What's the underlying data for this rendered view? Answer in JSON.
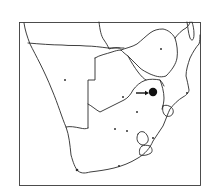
{
  "figure": {
    "type": "locator-map",
    "region": "Southern Africa",
    "background": "#ffffff",
    "stroke_color": "#2a2a2a",
    "frame": {
      "x": 19,
      "y": 22,
      "width": 182,
      "height": 164
    }
  },
  "markers": {
    "highlight": {
      "x": 153,
      "y": 92,
      "r": 4.2,
      "color": "#111111",
      "label": ""
    },
    "arrow": {
      "x1": 136,
      "y1": 93,
      "x2": 148,
      "y2": 93,
      "color": "#111111"
    },
    "dots": [
      {
        "name": "dot-namibia",
        "x": 65,
        "y": 80
      },
      {
        "name": "dot-botswana",
        "x": 123,
        "y": 97
      },
      {
        "name": "dot-zimbabwe",
        "x": 161,
        "y": 49
      },
      {
        "name": "dot-sa-1",
        "x": 137,
        "y": 112
      },
      {
        "name": "dot-sa-2",
        "x": 115,
        "y": 129
      },
      {
        "name": "dot-sa-3",
        "x": 127,
        "y": 131
      }
    ]
  }
}
